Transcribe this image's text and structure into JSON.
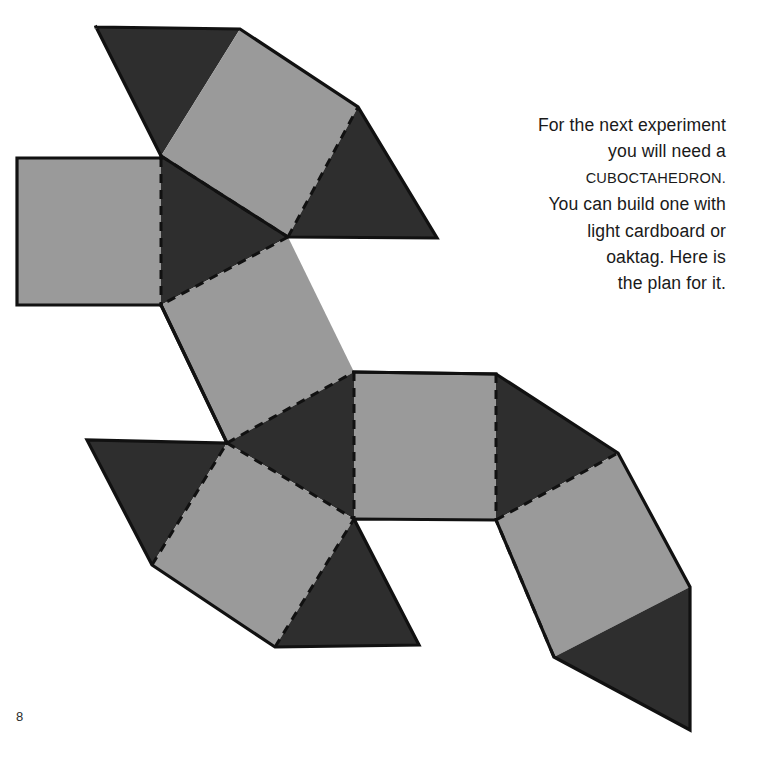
{
  "page": {
    "number": "8",
    "background_color": "#ffffff"
  },
  "caption": {
    "lines": [
      "For the next experiment",
      "you will need a",
      "CUBOCTAHEDRON.",
      "You can build one with",
      "light cardboard or",
      "oaktag. Here is",
      "the plan for it."
    ],
    "full_text": "For the next experiment you will need a CUBOCTAHEDRON. You can build one with light cardboard or oaktag. Here is the plan for it.",
    "smallcaps_line_index": 2,
    "text_color": "#1a1a1a"
  },
  "figure": {
    "name": "cuboctahedron-net",
    "colors": {
      "square_fill": "#9a9a9a",
      "triangle_fill": "#2e2e2e",
      "outline": "#111111",
      "fold_line": "#111111"
    },
    "stroke_widths": {
      "outline": 3.2,
      "fold": 3.0
    },
    "fold_dash_pattern": "9,7",
    "faces": [
      {
        "id": "triangle-top-left",
        "shape": "triangle",
        "fill": "triangle",
        "points": "96,27 240,29 161,156"
      },
      {
        "id": "square-top",
        "shape": "square",
        "fill": "square",
        "points": "240,29 358,107 288,237 161,156"
      },
      {
        "id": "triangle-top-right",
        "shape": "triangle",
        "fill": "triangle",
        "points": "358,107 437,238 288,237"
      },
      {
        "id": "square-left",
        "shape": "square",
        "fill": "square",
        "points": "17,158 161,158 161,305 17,305"
      },
      {
        "id": "triangle-center-upper",
        "shape": "triangle",
        "fill": "triangle",
        "points": "161,156 288,237 161,305"
      },
      {
        "id": "square-middle",
        "shape": "square",
        "fill": "square",
        "points": "161,305 288,237 354,372 227,443"
      },
      {
        "id": "triangle-center-lower",
        "shape": "triangle",
        "fill": "triangle",
        "points": "354,372 354,519 227,443"
      },
      {
        "id": "triangle-lower-left",
        "shape": "triangle",
        "fill": "triangle",
        "points": "87,440 227,443 152,565"
      },
      {
        "id": "square-lower-left",
        "shape": "square",
        "fill": "square",
        "points": "227,443 354,519 275,647 152,565"
      },
      {
        "id": "triangle-bottom",
        "shape": "triangle",
        "fill": "triangle",
        "points": "354,519 419,645 275,647"
      },
      {
        "id": "square-right",
        "shape": "square",
        "fill": "square",
        "points": "354,372 496,374 496,520 354,519"
      },
      {
        "id": "triangle-right",
        "shape": "triangle",
        "fill": "triangle",
        "points": "496,374 618,453 496,520"
      },
      {
        "id": "square-bottom-right",
        "shape": "square",
        "fill": "square",
        "points": "496,520 618,453 690,587 554,657"
      },
      {
        "id": "triangle-bottom-right",
        "shape": "triangle",
        "fill": "triangle",
        "points": "554,657 690,587 690,730"
      }
    ],
    "fold_lines": [
      "161,156 288,237",
      "288,237 161,305",
      "161,158 161,305",
      "288,237 358,107",
      "227,443 354,372",
      "354,372 354,519",
      "227,443 354,519",
      "152,565 227,443",
      "275,647 354,519",
      "496,374 496,520",
      "354,372 496,374",
      "354,519 496,520",
      "496,520 618,453",
      "554,657 496,520"
    ],
    "outer_boundary": [
      "96,27 240,29 358,107 437,238 288,237",
      "96,27 161,156 161,158 17,158 17,305 161,305",
      "358,107 437,238",
      "161,305 227,443 87,440 152,565 275,647 419,645 354,519 496,520 554,657 690,730 690,587 618,453 496,374 354,372"
    ]
  }
}
